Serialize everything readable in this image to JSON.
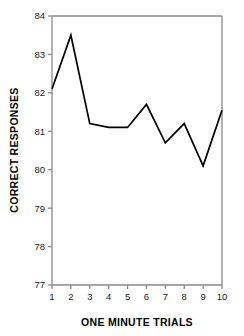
{
  "chart_data": {
    "type": "line",
    "title": "",
    "xlabel": "ONE MINUTE TRIALS",
    "ylabel": "CORRECT RESPONSES",
    "x": [
      1,
      2,
      3,
      4,
      5,
      6,
      7,
      8,
      9,
      10
    ],
    "values": [
      82.1,
      83.5,
      81.2,
      81.1,
      81.1,
      81.7,
      80.7,
      81.2,
      80.1,
      81.55
    ],
    "xtick_labels": [
      "1",
      "2",
      "3",
      "4",
      "5",
      "6",
      "7",
      "8",
      "9",
      "10"
    ],
    "ytick_labels": [
      "77",
      "78",
      "79",
      "80",
      "81",
      "82",
      "83",
      "84"
    ],
    "yticks": [
      77,
      78,
      79,
      80,
      81,
      82,
      83,
      84
    ],
    "ylim": [
      77,
      84
    ],
    "xlim": [
      1,
      10
    ],
    "grid": false,
    "legend": null,
    "line_color": "#000000",
    "axis_color": "#808080",
    "background_color": "#ffffff",
    "markers": false
  }
}
